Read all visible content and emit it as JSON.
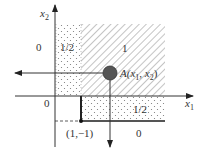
{
  "axes": {
    "x1_label": "x",
    "x1_sub": "1",
    "x2_label": "x",
    "x2_sub": "2"
  },
  "regions": [
    {
      "name": "left-outside",
      "value": "0"
    },
    {
      "name": "dotted-column",
      "value": "1/2"
    },
    {
      "name": "hatched-quadrant",
      "value": "1"
    },
    {
      "name": "origin-lower-left",
      "value": "0"
    },
    {
      "name": "dotted-band",
      "value": "1/2"
    },
    {
      "name": "bottom-outside",
      "value": "0"
    }
  ],
  "point_a": {
    "prefix": "A(",
    "var1": "x",
    "sub1": "1",
    "sep": ", ",
    "var2": "x",
    "sub2": "2",
    "suffix": ")"
  },
  "corner_point": {
    "label": "(1,−1)"
  },
  "colors": {
    "line": "#333333",
    "hatch": "#888888",
    "dot": "#777777",
    "point_fill": "#555555"
  }
}
